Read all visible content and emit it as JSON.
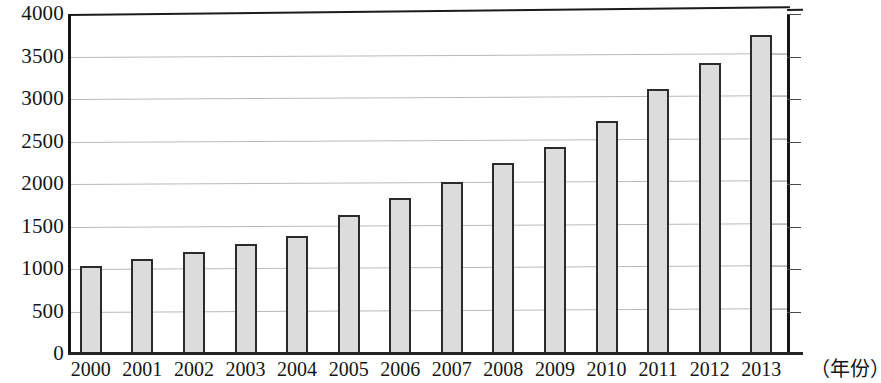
{
  "chart_data": {
    "type": "bar",
    "title": "",
    "subtitle": "",
    "xlabel": "（年份）",
    "ylabel": "",
    "categories": [
      "2000",
      "2001",
      "2002",
      "2003",
      "2004",
      "2005",
      "2006",
      "2007",
      "2008",
      "2009",
      "2010",
      "2011",
      "2012",
      "2013"
    ],
    "values": [
      1030,
      1115,
      1205,
      1290,
      1390,
      1630,
      1840,
      2020,
      2245,
      2440,
      2740,
      3120,
      3420,
      3750
    ],
    "series": [
      {
        "name": "",
        "values": [
          1030,
          1115,
          1205,
          1290,
          1390,
          1630,
          1840,
          2020,
          2245,
          2440,
          2740,
          3120,
          3420,
          3750
        ]
      }
    ],
    "ylim": [
      0,
      4000
    ],
    "y_ticks": [
      0,
      500,
      1000,
      1500,
      2000,
      2500,
      3000,
      3500,
      4000
    ],
    "y_tick_labels": [
      "0",
      "500",
      "1000",
      "1500",
      "2000",
      "2500",
      "3000",
      "3500",
      "4000"
    ],
    "grid": true,
    "legend": false,
    "legend_position": "none",
    "bar_fill_color": "#dcdcdc",
    "bar_edge_color": "#2b2b2b",
    "gridline_color": "#b9b9b9",
    "axis_color": "#161616",
    "background_color": "#ffffff"
  }
}
